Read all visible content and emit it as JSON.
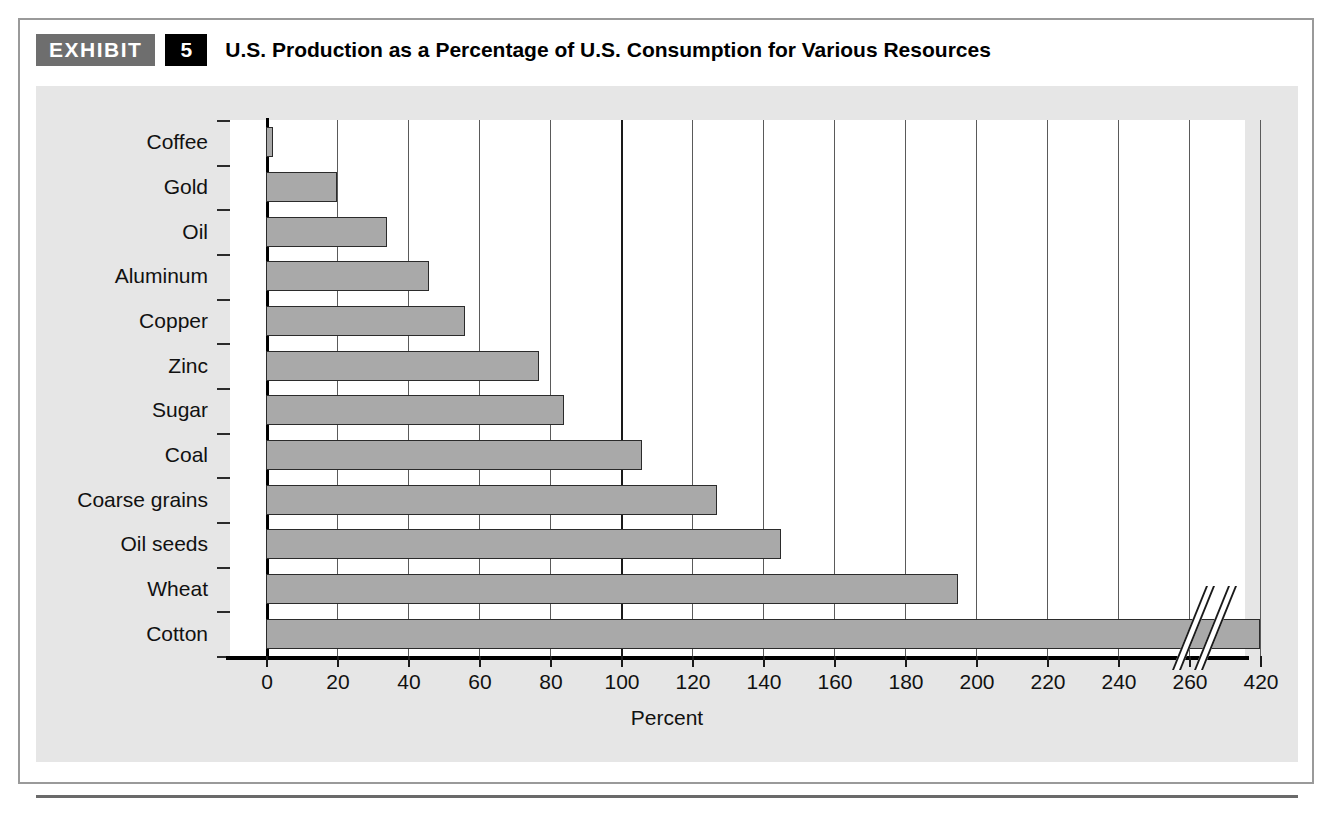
{
  "exhibit": {
    "badge_label": "EXHIBIT",
    "number": "5",
    "title": "U.S. Production as a Percentage of U.S. Consumption for Various Resources"
  },
  "chart_data": {
    "type": "bar",
    "orientation": "horizontal",
    "title": "U.S. Production as a Percentage of U.S. Consumption for Various Resources",
    "xlabel": "Percent",
    "ylabel": "",
    "categories": [
      "Coffee",
      "Gold",
      "Oil",
      "Aluminum",
      "Copper",
      "Zinc",
      "Sugar",
      "Coal",
      "Coarse grains",
      "Oil seeds",
      "Wheat",
      "Cotton"
    ],
    "values": [
      2,
      20,
      34,
      46,
      56,
      77,
      84,
      106,
      127,
      145,
      195,
      420
    ],
    "xticks": [
      0,
      20,
      40,
      60,
      80,
      100,
      120,
      140,
      160,
      180,
      200,
      220,
      240,
      260,
      420
    ],
    "xtick_labels": [
      "0",
      "20",
      "40",
      "60",
      "80",
      "100",
      "120",
      "140",
      "160",
      "180",
      "200",
      "220",
      "240",
      "260",
      "420"
    ],
    "xlim": [
      0,
      420
    ],
    "axis_break": {
      "present": true,
      "after_value": 260,
      "resumes_at_value": 420
    },
    "reference_line": 100,
    "grid": true,
    "legend": null,
    "bar_color": "#a9a9a9",
    "bar_edge_color": "#2b2b2b",
    "plot_background": "#ffffff",
    "panel_background": "#e6e6e6"
  },
  "colors": {
    "exhibit_badge_bg": "#6e6e6e",
    "number_badge_bg": "#000000",
    "badge_text": "#ffffff",
    "frame_border": "#9a9a9a",
    "text": "#111111",
    "bottom_rule": "#6a6a6a"
  }
}
